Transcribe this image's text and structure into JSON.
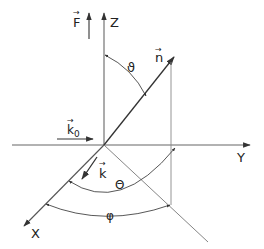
{
  "diagram": {
    "type": "3d-coordinate-system",
    "colors": {
      "line": "#555555",
      "text": "#222222",
      "background": "#ffffff"
    },
    "axes": {
      "z": {
        "label": "Z"
      },
      "y": {
        "label": "Y"
      },
      "x": {
        "label": "X"
      }
    },
    "vectors": {
      "force": {
        "label": "F",
        "accent": "→"
      },
      "normal": {
        "label": "n",
        "accent": "→"
      },
      "incident_wave": {
        "label": "k",
        "subscript": "0",
        "accent": "→"
      },
      "scattered_wave": {
        "label": "k",
        "accent": "→"
      }
    },
    "angles": {
      "theta_small": {
        "label": "ϑ"
      },
      "theta_big": {
        "label": "Θ"
      },
      "phi": {
        "label": "φ"
      }
    }
  }
}
